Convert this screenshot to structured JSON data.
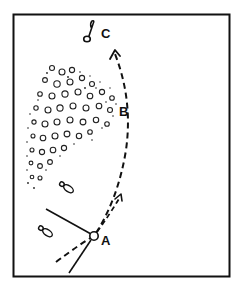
{
  "diagram": {
    "type": "golf-shot-path-illustration",
    "labels": {
      "a": "A",
      "b": "B",
      "c": "C"
    },
    "elements": {
      "frame": "rectangular border",
      "point_a": "circle marking ball position",
      "point_b": "edge of shrubbery/trees",
      "point_c": "flag/hole target",
      "curved_path": "dashed curved flight path from A around B toward C",
      "short_path": "short dashed arrow from A",
      "aim_lines": "two solid lines converging at A",
      "footprints": "two footprint shapes",
      "shrubbery": "dotted foliage mass"
    },
    "colors": {
      "ink": "#111111",
      "background": "#ffffff"
    }
  }
}
